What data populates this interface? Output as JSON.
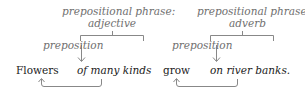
{
  "diagram": {
    "left": {
      "header_line1": "prepositional phrase:",
      "header_line2": "adjective",
      "preposition_label": "preposition",
      "modified_word": "Flowers",
      "phrase": "of many kinds"
    },
    "right": {
      "header_line1": "prepositional phrase:",
      "header_line2": "adverb",
      "preposition_label": "preposition",
      "modified_word": "grow",
      "phrase": "on river banks."
    },
    "colors": {
      "text": "#222222",
      "label": "#6f6f6f",
      "lines": "#888888"
    }
  }
}
